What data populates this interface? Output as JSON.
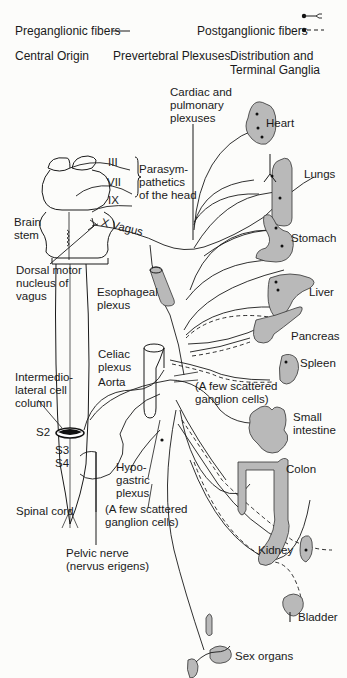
{
  "legend": {
    "preganglionic": "Preganglionic fibers",
    "postganglionic": "Postganglionic fibers",
    "preganglionic_symbol": "solid-line",
    "postganglionic_symbols": [
      "dot-with-fork-ending",
      "dot-with-dashed-line"
    ]
  },
  "column_headers": {
    "central_origin": "Central Origin",
    "prevertebral": "Prevertebral Plexuses",
    "distribution": "Distribution and\nTerminal Ganglia"
  },
  "labels": {
    "cardiac": "Cardiac and\npulmonary\nplexuses",
    "cn3": "III",
    "cn7": "VII",
    "cn9": "IX",
    "parasym_head": "Parasym-\npathetics\nof the head",
    "brain_stem": "Brain\nstem",
    "vagus": "X Vagus",
    "dorsal_motor": "Dorsal motor\nnucleus of\nvagus",
    "esophageal": "Esophageal\nplexus",
    "celiac": "Celiac\nplexus",
    "aorta": "Aorta",
    "scattered_upper": "(A few scattered\nganglion cells)",
    "intermedio": "Intermedio-\nlateral cell\ncolumn",
    "s2": "S2",
    "s3": "S3",
    "s4": "S4",
    "hypogastric": "Hypo-\ngastric\nplexus",
    "spinal_cord": "Spinal cord",
    "scattered_lower": "(A few scattered\nganglion cells)",
    "pelvic_nerve": "Pelvic nerve\n(nervus erigens)"
  },
  "organs": [
    {
      "id": "heart",
      "label": "Heart"
    },
    {
      "id": "lungs",
      "label": "Lungs"
    },
    {
      "id": "stomach",
      "label": "Stomach"
    },
    {
      "id": "liver",
      "label": "Liver"
    },
    {
      "id": "pancreas",
      "label": "Pancreas"
    },
    {
      "id": "spleen",
      "label": "Spleen"
    },
    {
      "id": "small-intestine",
      "label": "Small\nintestine"
    },
    {
      "id": "colon",
      "label": "Colon"
    },
    {
      "id": "kidney",
      "label": "Kidney"
    },
    {
      "id": "bladder",
      "label": "Bladder"
    },
    {
      "id": "sex-organs",
      "label": "Sex organs"
    }
  ],
  "colors": {
    "organ_fill": "#b9b9b9",
    "line": "#1a1a1a",
    "background": "#fcfcfa"
  }
}
